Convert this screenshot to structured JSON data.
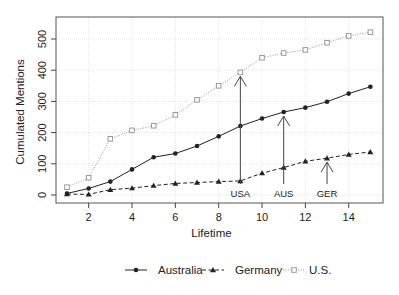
{
  "chart_data": {
    "type": "line",
    "title": "",
    "xlabel": "Lifetime",
    "ylabel": "Cumulated Mentions",
    "x": [
      1,
      2,
      3,
      4,
      5,
      6,
      7,
      8,
      9,
      10,
      11,
      12,
      13,
      14,
      15
    ],
    "xlim": [
      0.5,
      15.6
    ],
    "ylim": [
      -25,
      570
    ],
    "x_ticks": [
      2,
      4,
      6,
      8,
      10,
      12,
      14
    ],
    "y_ticks": [
      0,
      100,
      200,
      300,
      400,
      500
    ],
    "grid": true,
    "legend_position": "bottom",
    "series": [
      {
        "name": "Australia",
        "marker": "filled-circle",
        "line_style": "solid",
        "color": "#222222",
        "values": [
          5,
          21,
          43,
          82,
          121,
          133,
          157,
          188,
          221,
          245,
          266,
          280,
          299,
          325,
          347
        ]
      },
      {
        "name": "Germany",
        "marker": "filled-triangle",
        "line_style": "dashed",
        "color": "#222222",
        "values": [
          3,
          2,
          17,
          22,
          30,
          37,
          40,
          43,
          45,
          70,
          88,
          108,
          118,
          130,
          138
        ]
      },
      {
        "name": "U.S.",
        "marker": "open-square",
        "line_style": "dotted",
        "color": "#999999",
        "values": [
          25,
          55,
          180,
          207,
          222,
          257,
          305,
          350,
          393,
          440,
          455,
          465,
          488,
          510,
          522
        ]
      }
    ],
    "annotations": [
      {
        "label": "USA",
        "x": 9,
        "target_series": "U.S.",
        "target_y": 393
      },
      {
        "label": "AUS",
        "x": 11,
        "target_series": "Australia",
        "target_y": 266
      },
      {
        "label": "GER",
        "x": 13,
        "target_series": "Germany",
        "target_y": 118
      }
    ]
  }
}
